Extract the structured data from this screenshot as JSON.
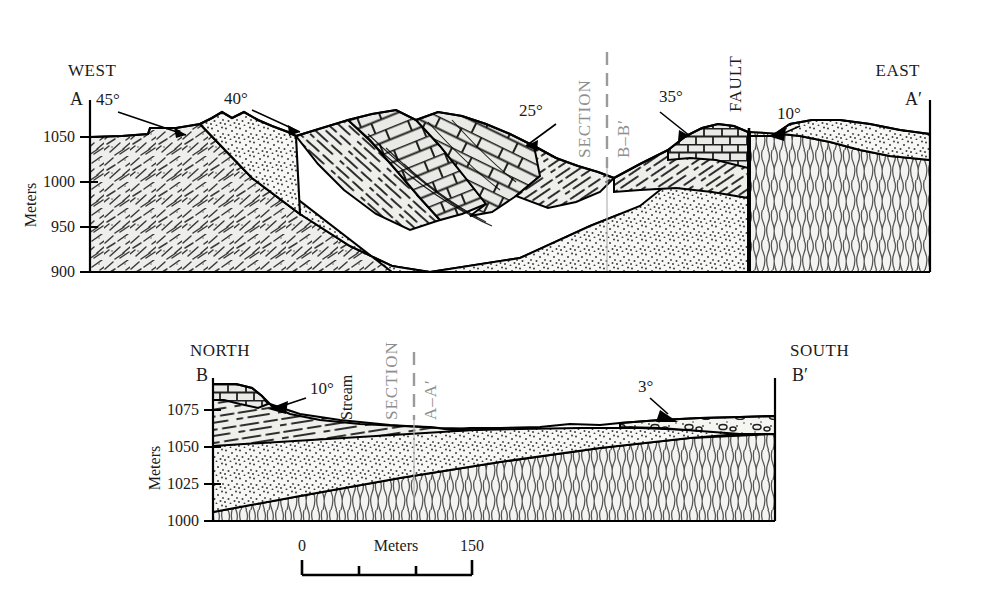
{
  "figure": {
    "type": "geologic-cross-section",
    "panels": [
      {
        "id": "A-A-prime",
        "left_compass": "WEST",
        "right_compass": "EAST",
        "left_end": "A",
        "right_end": "A′",
        "axis_label": "Meters",
        "axis_ticks": [
          "1050",
          "1000",
          "950",
          "900"
        ],
        "section_line_label_1": "SECTION",
        "section_line_label_2": "B–B′",
        "fault_label": "FAULT",
        "dips": [
          "45°",
          "40°",
          "25°",
          "35°",
          "10°"
        ]
      },
      {
        "id": "B-B-prime",
        "left_compass": "NORTH",
        "right_compass": "SOUTH",
        "left_end": "B",
        "right_end": "B′",
        "axis_label": "Meters",
        "axis_ticks": [
          "1075",
          "1050",
          "1025",
          "1000"
        ],
        "section_line_label_1": "SECTION",
        "section_line_label_2": "A–A′",
        "stream_label": "Stream",
        "dips": [
          "10°",
          "3°"
        ]
      }
    ],
    "scalebar": {
      "label": "Meters",
      "min": "0",
      "max": "150",
      "divisions": 3
    },
    "colors": {
      "ink": "#1b1b1b",
      "section_gray": "#9a9a9a",
      "fill_light": "#f2f2f0",
      "fill_mid": "#e8e8e4"
    }
  }
}
